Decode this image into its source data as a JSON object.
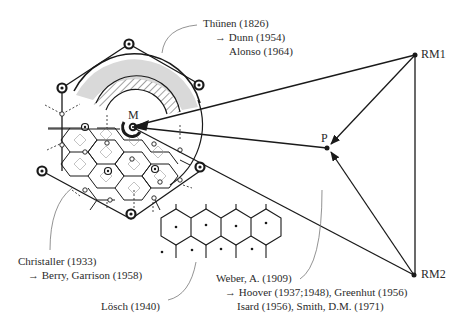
{
  "diagram": {
    "nodes": {
      "market": "M",
      "plant": "P",
      "raw_material_1": "RM1",
      "raw_material_2": "RM2"
    },
    "citations": {
      "thunen": {
        "line1": "Thünen (1826)",
        "line2": "→ Dunn (1954)",
        "line3": "Alonso (1964)"
      },
      "christaller": {
        "line1": "Christaller (1933)",
        "line2": "→ Berry, Garrison (1958)"
      },
      "losch": {
        "line1": "Lösch (1940)"
      },
      "weber": {
        "line1": "Weber, A. (1909)",
        "line2": "→ Hoover (1937;1948),  Greenhut (1956)",
        "line3": "Isard (1956),  Smith, D.M. (1971)"
      }
    },
    "colors": {
      "line": "#1a1a1a",
      "ring_fill": "#d9d9d9",
      "thin_grid": "#8a8a8a",
      "leader": "#777777"
    }
  }
}
